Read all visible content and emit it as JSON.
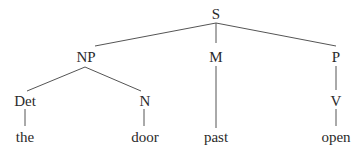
{
  "tree": {
    "root": {
      "label": "S",
      "children": [
        {
          "label": "NP",
          "children": [
            {
              "label": "Det",
              "children": [
                {
                  "label": "the"
                }
              ]
            },
            {
              "label": "N",
              "children": [
                {
                  "label": "door"
                }
              ]
            }
          ]
        },
        {
          "label": "M",
          "children": [
            {
              "label": "past"
            }
          ]
        },
        {
          "label": "P",
          "children": [
            {
              "label": "V",
              "children": [
                {
                  "label": "open"
                }
              ]
            }
          ]
        }
      ]
    }
  },
  "nodes": {
    "s": "S",
    "np": "NP",
    "m": "M",
    "p": "P",
    "det": "Det",
    "n": "N",
    "v": "V",
    "the": "the",
    "door": "door",
    "past": "past",
    "open": "open"
  },
  "colors": {
    "text": "#2a2a2a",
    "edge": "#555555",
    "background": "#ffffff"
  }
}
